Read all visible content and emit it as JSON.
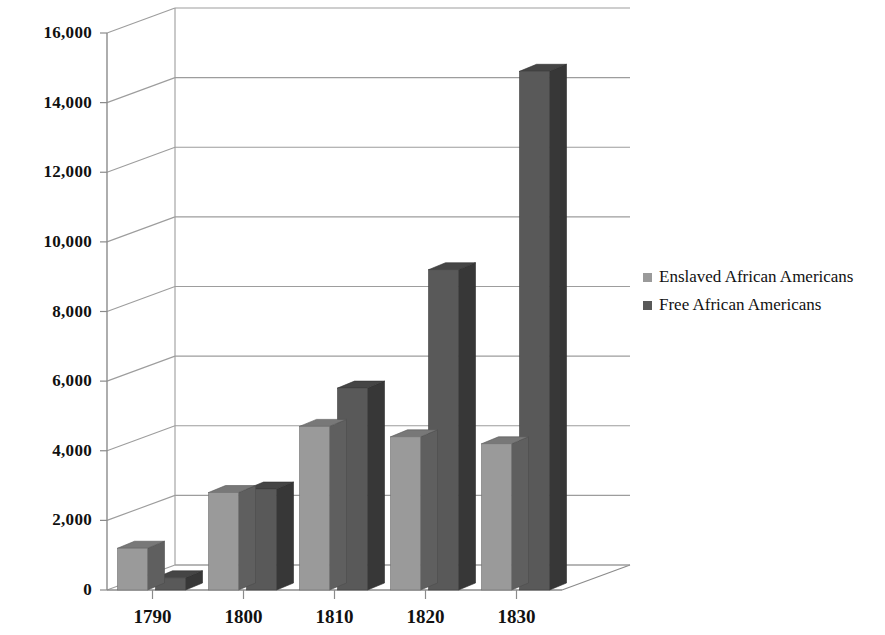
{
  "chart_data": {
    "type": "bar",
    "title": "",
    "subtitle": "",
    "xlabel": "",
    "ylabel": "",
    "categories": [
      "1790",
      "1800",
      "1810",
      "1820",
      "1830"
    ],
    "series": [
      {
        "name": "Enslaved African Americans",
        "color": "#9a9a9a",
        "values": [
          1200,
          2800,
          4700,
          4400,
          4200
        ]
      },
      {
        "name": "Free African Americans",
        "color": "#595959",
        "values": [
          350,
          2900,
          5800,
          9200,
          14900
        ]
      }
    ],
    "ylim": [
      0,
      16000
    ],
    "ytick_labels": [
      "0",
      "2,000",
      "4,000",
      "6,000",
      "8,000",
      "10,000",
      "12,000",
      "14,000",
      "16,000"
    ],
    "ytick_values": [
      0,
      2000,
      4000,
      6000,
      8000,
      10000,
      12000,
      14000,
      16000
    ],
    "grid": true,
    "grid_axis": "y",
    "legend_position": "right",
    "style": "3d-clustered-column"
  },
  "legend": {
    "items": [
      {
        "label": "Enslaved African Americans",
        "color": "#9a9a9a"
      },
      {
        "label": "Free African Americans",
        "color": "#595959"
      }
    ]
  },
  "colors": {
    "series_enslaved": "#9a9a9a",
    "series_free": "#595959",
    "axis": "#8b8b8b",
    "grid": "#9d9d9d",
    "text": "#111111",
    "background": "#ffffff"
  }
}
